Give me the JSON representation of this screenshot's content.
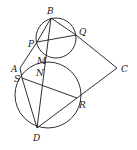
{
  "diagram": {
    "type": "geometry",
    "labels": {
      "B": "B",
      "P": "P",
      "Q": "Q",
      "M": "M",
      "A": "A",
      "N": "N",
      "S": "S",
      "C": "C",
      "R": "R",
      "D": "D"
    },
    "points": {
      "B": [
        51,
        18
      ],
      "P": [
        37,
        42
      ],
      "Q": [
        76,
        35
      ],
      "M": [
        46,
        62
      ],
      "A": [
        20,
        68
      ],
      "N": [
        45,
        72
      ],
      "S": [
        22,
        78
      ],
      "C": [
        117,
        68
      ],
      "R": [
        77,
        98
      ],
      "D": [
        37,
        128
      ]
    },
    "circles": [
      {
        "name": "upper-circle",
        "center": [
          56,
          38
        ],
        "r": 20
      },
      {
        "name": "lower-circle",
        "center": [
          48,
          95
        ],
        "r": 33
      }
    ],
    "segments": [
      [
        "B",
        "Q"
      ],
      [
        "Q",
        "C"
      ],
      [
        "C",
        "R"
      ],
      [
        "R",
        "D"
      ],
      [
        "P",
        "Q"
      ],
      [
        "B",
        "D"
      ],
      [
        "A",
        "P"
      ],
      [
        "A",
        "S"
      ],
      [
        "S",
        "D"
      ],
      [
        "S",
        "R"
      ]
    ]
  }
}
